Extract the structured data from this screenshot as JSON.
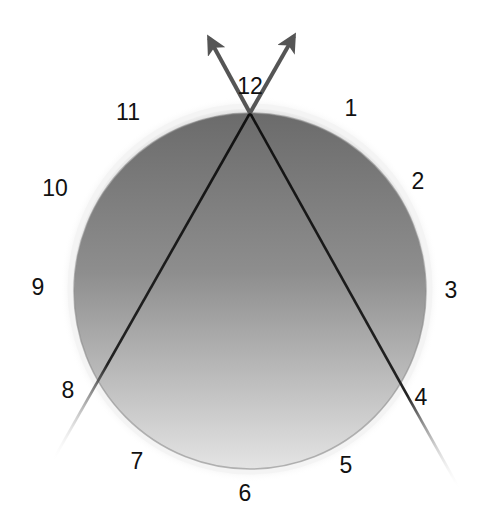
{
  "diagram": {
    "title": "",
    "type": "clock-face-diagram",
    "circle": {
      "cx": 250,
      "cy": 289,
      "rx": 178,
      "ry": 181,
      "fill_top": "#6b6b6b",
      "fill_bottom": "#e2e2e2",
      "rim_color": "#f4f4f4",
      "shadow_color": "#9a9a9a"
    },
    "crossing_point": {
      "x": 250,
      "y": 113
    },
    "lines": [
      {
        "id": "line-left",
        "from": [
          52,
          462
        ],
        "to": [
          250,
          113
        ],
        "color": "#111111"
      },
      {
        "id": "line-right",
        "from": [
          460,
          490
        ],
        "to": [
          250,
          113
        ],
        "color": "#111111"
      }
    ],
    "arrows": [
      {
        "id": "arrow-left",
        "from": [
          250,
          113
        ],
        "tip": [
          209,
          38
        ],
        "color": "#555555"
      },
      {
        "id": "arrow-right",
        "from": [
          250,
          113
        ],
        "tip": [
          294,
          36
        ],
        "color": "#555555"
      }
    ],
    "hour_labels": [
      {
        "text": "12",
        "x": 250,
        "y": 86
      },
      {
        "text": "1",
        "x": 351,
        "y": 108
      },
      {
        "text": "2",
        "x": 418,
        "y": 181
      },
      {
        "text": "3",
        "x": 451,
        "y": 290
      },
      {
        "text": "4",
        "x": 421,
        "y": 397
      },
      {
        "text": "5",
        "x": 346,
        "y": 465
      },
      {
        "text": "6",
        "x": 245,
        "y": 493
      },
      {
        "text": "7",
        "x": 137,
        "y": 461
      },
      {
        "text": "8",
        "x": 68,
        "y": 390
      },
      {
        "text": "9",
        "x": 38,
        "y": 287
      },
      {
        "text": "10",
        "x": 55,
        "y": 188
      },
      {
        "text": "11",
        "x": 128,
        "y": 112
      }
    ]
  }
}
